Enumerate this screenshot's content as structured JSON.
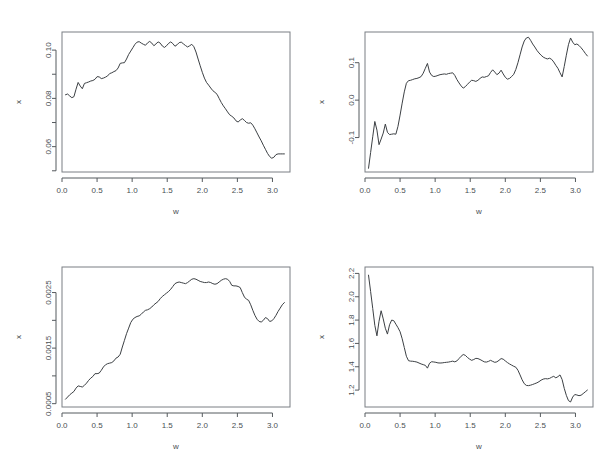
{
  "figure": {
    "layout": "2x2 grid of line plots",
    "background": "#ffffff",
    "line_color": "#3c4044",
    "axis_color": "#555a5e"
  },
  "chart_data": [
    {
      "type": "line",
      "panel": "top-left",
      "title": "",
      "xlabel": "w",
      "ylabel": "x",
      "xlim": [
        0.0,
        3.25
      ],
      "ylim": [
        0.0495,
        0.1075
      ],
      "xticks": [
        0.0,
        0.5,
        1.0,
        1.5,
        2.0,
        2.5,
        3.0
      ],
      "xticklabels": [
        "0.0",
        "0.5",
        "1.0",
        "1.5",
        "2.0",
        "2.5",
        "3.0"
      ],
      "yticks": [
        0.06,
        0.08,
        0.1
      ],
      "yticklabels": [
        "0.06",
        "0.08",
        "0.10"
      ],
      "yminorticks": [
        0.05,
        0.07,
        0.09
      ],
      "grid": false,
      "legend": null,
      "x": [
        0.05,
        0.08,
        0.11,
        0.14,
        0.17,
        0.2,
        0.23,
        0.26,
        0.29,
        0.32,
        0.35,
        0.38,
        0.41,
        0.44,
        0.47,
        0.5,
        0.53,
        0.56,
        0.59,
        0.62,
        0.65,
        0.68,
        0.71,
        0.74,
        0.77,
        0.8,
        0.83,
        0.86,
        0.89,
        0.92,
        0.95,
        0.98,
        1.01,
        1.04,
        1.07,
        1.1,
        1.13,
        1.16,
        1.19,
        1.22,
        1.25,
        1.28,
        1.31,
        1.34,
        1.37,
        1.4,
        1.43,
        1.46,
        1.49,
        1.52,
        1.55,
        1.58,
        1.61,
        1.64,
        1.67,
        1.7,
        1.73,
        1.76,
        1.79,
        1.82,
        1.85,
        1.88,
        1.91,
        1.94,
        1.97,
        2.0,
        2.03,
        2.06,
        2.09,
        2.12,
        2.15,
        2.18,
        2.21,
        2.24,
        2.27,
        2.3,
        2.33,
        2.36,
        2.39,
        2.42,
        2.45,
        2.48,
        2.51,
        2.54,
        2.57,
        2.6,
        2.63,
        2.66,
        2.69,
        2.72,
        2.75,
        2.78,
        2.81,
        2.84,
        2.87,
        2.9,
        2.93,
        2.96,
        2.99,
        3.02,
        3.05,
        3.08,
        3.11,
        3.14,
        3.17
      ],
      "y": [
        0.0815,
        0.0818,
        0.081,
        0.0803,
        0.0807,
        0.0838,
        0.0866,
        0.0851,
        0.084,
        0.0862,
        0.0865,
        0.0868,
        0.0872,
        0.0874,
        0.0879,
        0.089,
        0.0889,
        0.0882,
        0.0884,
        0.0888,
        0.0893,
        0.0903,
        0.0906,
        0.0911,
        0.0915,
        0.0926,
        0.0945,
        0.0947,
        0.0948,
        0.0963,
        0.0982,
        0.0996,
        0.101,
        0.1024,
        0.1033,
        0.1035,
        0.1029,
        0.1024,
        0.102,
        0.103,
        0.1036,
        0.1029,
        0.1018,
        0.1026,
        0.1034,
        0.1029,
        0.1017,
        0.1011,
        0.1018,
        0.1028,
        0.1034,
        0.1027,
        0.1016,
        0.1022,
        0.1031,
        0.1033,
        0.1026,
        0.1019,
        0.1013,
        0.1018,
        0.1024,
        0.1014,
        0.0992,
        0.0963,
        0.0935,
        0.0908,
        0.0884,
        0.0866,
        0.0855,
        0.0843,
        0.0832,
        0.0825,
        0.0817,
        0.08,
        0.0783,
        0.0769,
        0.0757,
        0.0744,
        0.0732,
        0.0726,
        0.0719,
        0.0707,
        0.0702,
        0.071,
        0.0716,
        0.0709,
        0.07,
        0.0697,
        0.0699,
        0.0689,
        0.0674,
        0.0657,
        0.064,
        0.0624,
        0.0606,
        0.0589,
        0.0572,
        0.0559,
        0.0552,
        0.0556,
        0.0567,
        0.057,
        0.057,
        0.057,
        0.057
      ]
    },
    {
      "type": "line",
      "panel": "top-right",
      "title": "",
      "xlabel": "w",
      "ylabel": "x",
      "xlim": [
        0.0,
        3.25
      ],
      "ylim": [
        -0.192,
        0.182
      ],
      "xticks": [
        0.0,
        0.5,
        1.0,
        1.5,
        2.0,
        2.5,
        3.0
      ],
      "xticklabels": [
        "0.0",
        "0.5",
        "1.0",
        "1.5",
        "2.0",
        "2.5",
        "3.0"
      ],
      "yticks": [
        -0.1,
        0.0,
        0.1
      ],
      "yticklabels": [
        "-0.1",
        "0.0",
        "0.1"
      ],
      "yminorticks": [],
      "grid": false,
      "legend": null,
      "x": [
        0.05,
        0.08,
        0.11,
        0.14,
        0.17,
        0.2,
        0.23,
        0.26,
        0.29,
        0.32,
        0.35,
        0.38,
        0.41,
        0.44,
        0.47,
        0.5,
        0.53,
        0.56,
        0.59,
        0.62,
        0.65,
        0.68,
        0.71,
        0.74,
        0.77,
        0.8,
        0.83,
        0.86,
        0.89,
        0.92,
        0.95,
        0.98,
        1.01,
        1.04,
        1.07,
        1.1,
        1.13,
        1.16,
        1.19,
        1.22,
        1.25,
        1.28,
        1.31,
        1.34,
        1.37,
        1.4,
        1.43,
        1.46,
        1.49,
        1.52,
        1.55,
        1.58,
        1.61,
        1.64,
        1.67,
        1.7,
        1.73,
        1.76,
        1.79,
        1.82,
        1.85,
        1.88,
        1.91,
        1.94,
        1.97,
        2.0,
        2.03,
        2.06,
        2.09,
        2.12,
        2.15,
        2.18,
        2.21,
        2.24,
        2.27,
        2.3,
        2.33,
        2.36,
        2.39,
        2.42,
        2.45,
        2.48,
        2.51,
        2.54,
        2.57,
        2.6,
        2.63,
        2.66,
        2.69,
        2.72,
        2.75,
        2.78,
        2.81,
        2.84,
        2.87,
        2.9,
        2.93,
        2.96,
        2.99,
        3.02,
        3.05,
        3.08,
        3.11,
        3.14,
        3.17
      ],
      "y": [
        -0.182,
        -0.14,
        -0.098,
        -0.057,
        -0.08,
        -0.119,
        -0.104,
        -0.088,
        -0.064,
        -0.086,
        -0.092,
        -0.091,
        -0.09,
        -0.091,
        -0.07,
        -0.04,
        -0.008,
        0.022,
        0.045,
        0.052,
        0.053,
        0.055,
        0.057,
        0.058,
        0.06,
        0.063,
        0.072,
        0.085,
        0.098,
        0.075,
        0.066,
        0.063,
        0.064,
        0.066,
        0.068,
        0.069,
        0.07,
        0.069,
        0.071,
        0.072,
        0.073,
        0.066,
        0.055,
        0.046,
        0.038,
        0.032,
        0.036,
        0.042,
        0.048,
        0.053,
        0.052,
        0.05,
        0.053,
        0.058,
        0.062,
        0.061,
        0.063,
        0.065,
        0.074,
        0.081,
        0.075,
        0.068,
        0.072,
        0.08,
        0.07,
        0.061,
        0.056,
        0.058,
        0.063,
        0.069,
        0.082,
        0.1,
        0.121,
        0.142,
        0.158,
        0.166,
        0.168,
        0.16,
        0.15,
        0.142,
        0.133,
        0.126,
        0.12,
        0.115,
        0.112,
        0.11,
        0.112,
        0.109,
        0.102,
        0.093,
        0.085,
        0.073,
        0.062,
        0.09,
        0.12,
        0.148,
        0.166,
        0.155,
        0.148,
        0.15,
        0.146,
        0.14,
        0.133,
        0.125,
        0.118
      ]
    },
    {
      "type": "line",
      "panel": "bottom-left",
      "title": "",
      "xlabel": "w",
      "ylabel": "x",
      "xlim": [
        0.0,
        3.25
      ],
      "ylim": [
        0.00044,
        0.00296
      ],
      "xticks": [
        0.0,
        0.5,
        1.0,
        1.5,
        2.0,
        2.5,
        3.0
      ],
      "xticklabels": [
        "0.0",
        "0.5",
        "1.0",
        "1.5",
        "2.0",
        "2.5",
        "3.0"
      ],
      "yticks": [
        0.0005,
        0.0015,
        0.0025
      ],
      "yticklabels": [
        "0.0005",
        "0.0015",
        "0.0025"
      ],
      "yminorticks": [
        0.001,
        0.002
      ],
      "grid": false,
      "legend": null,
      "x": [
        0.05,
        0.08,
        0.11,
        0.14,
        0.17,
        0.2,
        0.23,
        0.26,
        0.29,
        0.32,
        0.35,
        0.38,
        0.41,
        0.44,
        0.47,
        0.5,
        0.53,
        0.56,
        0.59,
        0.62,
        0.65,
        0.68,
        0.71,
        0.74,
        0.77,
        0.8,
        0.83,
        0.86,
        0.89,
        0.92,
        0.95,
        0.98,
        1.01,
        1.04,
        1.07,
        1.1,
        1.13,
        1.16,
        1.19,
        1.22,
        1.25,
        1.28,
        1.31,
        1.34,
        1.37,
        1.4,
        1.43,
        1.46,
        1.49,
        1.52,
        1.55,
        1.58,
        1.61,
        1.64,
        1.67,
        1.7,
        1.73,
        1.76,
        1.79,
        1.82,
        1.85,
        1.88,
        1.91,
        1.94,
        1.97,
        2.0,
        2.03,
        2.06,
        2.09,
        2.12,
        2.15,
        2.18,
        2.21,
        2.24,
        2.27,
        2.3,
        2.33,
        2.36,
        2.39,
        2.42,
        2.45,
        2.48,
        2.51,
        2.54,
        2.57,
        2.6,
        2.63,
        2.66,
        2.69,
        2.72,
        2.75,
        2.78,
        2.81,
        2.84,
        2.87,
        2.9,
        2.93,
        2.96,
        2.99,
        3.02,
        3.05,
        3.08,
        3.11,
        3.14,
        3.17
      ],
      "y": [
        0.00058,
        0.00062,
        0.00066,
        0.00069,
        0.00072,
        0.00078,
        0.00082,
        0.00081,
        0.0008,
        0.00083,
        0.00087,
        0.00092,
        0.00096,
        0.00099,
        0.00104,
        0.00104,
        0.00105,
        0.0011,
        0.00116,
        0.0012,
        0.00122,
        0.00123,
        0.00124,
        0.00127,
        0.00132,
        0.00134,
        0.00139,
        0.00152,
        0.00164,
        0.00176,
        0.00186,
        0.00196,
        0.00202,
        0.00205,
        0.00207,
        0.00208,
        0.00211,
        0.00215,
        0.00218,
        0.00219,
        0.00221,
        0.00224,
        0.00228,
        0.00231,
        0.00234,
        0.00239,
        0.00243,
        0.00246,
        0.00249,
        0.00252,
        0.00256,
        0.00261,
        0.00266,
        0.00268,
        0.00269,
        0.00268,
        0.00267,
        0.00266,
        0.00268,
        0.00271,
        0.00274,
        0.00275,
        0.00274,
        0.00272,
        0.0027,
        0.00269,
        0.00268,
        0.00268,
        0.00269,
        0.00268,
        0.00266,
        0.00265,
        0.00266,
        0.00269,
        0.00272,
        0.00274,
        0.00275,
        0.00274,
        0.0027,
        0.00263,
        0.00262,
        0.00262,
        0.00261,
        0.00259,
        0.0025,
        0.00242,
        0.00238,
        0.00236,
        0.00228,
        0.00218,
        0.00209,
        0.00202,
        0.00198,
        0.00197,
        0.002,
        0.00205,
        0.00203,
        0.00198,
        0.00199,
        0.00203,
        0.00209,
        0.00216,
        0.00222,
        0.00228,
        0.00232
      ]
    },
    {
      "type": "line",
      "panel": "bottom-right",
      "title": "",
      "xlabel": "w",
      "ylabel": "x",
      "xlim": [
        0.0,
        3.25
      ],
      "ylim": [
        1.055,
        2.255
      ],
      "xticks": [
        0.0,
        0.5,
        1.0,
        1.5,
        2.0,
        2.5,
        3.0
      ],
      "xticklabels": [
        "0.0",
        "0.5",
        "1.0",
        "1.5",
        "2.0",
        "2.5",
        "3.0"
      ],
      "yticks": [
        1.2,
        1.4,
        1.6,
        1.8,
        2.0,
        2.2
      ],
      "yticklabels": [
        "1.2",
        "1.4",
        "1.6",
        "1.8",
        "2.0",
        "2.2"
      ],
      "yminorticks": [],
      "grid": false,
      "legend": null,
      "x": [
        0.05,
        0.08,
        0.11,
        0.14,
        0.17,
        0.2,
        0.23,
        0.26,
        0.29,
        0.32,
        0.35,
        0.38,
        0.41,
        0.44,
        0.47,
        0.5,
        0.53,
        0.56,
        0.59,
        0.62,
        0.65,
        0.68,
        0.71,
        0.74,
        0.77,
        0.8,
        0.83,
        0.86,
        0.89,
        0.92,
        0.95,
        0.98,
        1.01,
        1.04,
        1.07,
        1.1,
        1.13,
        1.16,
        1.19,
        1.22,
        1.25,
        1.28,
        1.31,
        1.34,
        1.37,
        1.4,
        1.43,
        1.46,
        1.49,
        1.52,
        1.55,
        1.58,
        1.61,
        1.64,
        1.67,
        1.7,
        1.73,
        1.76,
        1.79,
        1.82,
        1.85,
        1.88,
        1.91,
        1.94,
        1.97,
        2.0,
        2.03,
        2.06,
        2.09,
        2.12,
        2.15,
        2.18,
        2.21,
        2.24,
        2.27,
        2.3,
        2.33,
        2.36,
        2.39,
        2.42,
        2.45,
        2.48,
        2.51,
        2.54,
        2.57,
        2.6,
        2.63,
        2.66,
        2.69,
        2.72,
        2.75,
        2.78,
        2.81,
        2.84,
        2.87,
        2.9,
        2.93,
        2.96,
        2.99,
        3.02,
        3.05,
        3.08,
        3.11,
        3.14,
        3.17
      ],
      "y": [
        2.185,
        2.045,
        1.9,
        1.755,
        1.665,
        1.79,
        1.88,
        1.81,
        1.73,
        1.68,
        1.76,
        1.8,
        1.795,
        1.765,
        1.735,
        1.7,
        1.64,
        1.565,
        1.49,
        1.452,
        1.448,
        1.447,
        1.444,
        1.44,
        1.432,
        1.424,
        1.418,
        1.412,
        1.388,
        1.43,
        1.443,
        1.441,
        1.438,
        1.433,
        1.432,
        1.433,
        1.436,
        1.438,
        1.44,
        1.444,
        1.448,
        1.442,
        1.45,
        1.47,
        1.49,
        1.505,
        1.498,
        1.48,
        1.466,
        1.455,
        1.462,
        1.472,
        1.47,
        1.462,
        1.452,
        1.442,
        1.44,
        1.446,
        1.455,
        1.446,
        1.438,
        1.442,
        1.455,
        1.47,
        1.465,
        1.45,
        1.436,
        1.424,
        1.414,
        1.404,
        1.396,
        1.37,
        1.33,
        1.288,
        1.255,
        1.24,
        1.238,
        1.242,
        1.248,
        1.255,
        1.262,
        1.272,
        1.285,
        1.294,
        1.298,
        1.296,
        1.3,
        1.31,
        1.318,
        1.305,
        1.315,
        1.33,
        1.29,
        1.215,
        1.155,
        1.11,
        1.098,
        1.14,
        1.162,
        1.158,
        1.152,
        1.156,
        1.17,
        1.185,
        1.2
      ]
    }
  ]
}
